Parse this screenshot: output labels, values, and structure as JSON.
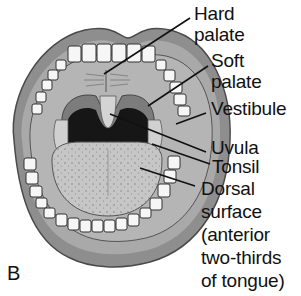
{
  "panel_letter": "B",
  "labels": [
    {
      "id": "hard-palate",
      "lines": [
        "Hard",
        "palate"
      ]
    },
    {
      "id": "soft-palate",
      "lines": [
        "Soft",
        "palate"
      ]
    },
    {
      "id": "vestibule",
      "lines": [
        "Vestibule"
      ]
    },
    {
      "id": "uvula",
      "lines": [
        "Uvula"
      ]
    },
    {
      "id": "tonsil",
      "lines": [
        "Tonsil"
      ]
    },
    {
      "id": "dorsal-surface",
      "lines": [
        "Dorsal",
        "surface",
        "(anterior",
        "two-thirds",
        "of tongue)"
      ]
    }
  ],
  "colors": {
    "lip": "#8a8a8a",
    "lip_edge": "#555555",
    "oral_cavity": "#b8b8b8",
    "pharynx": "#1a1a1a",
    "tongue": "#c4c4c4",
    "teeth": "#f4f4f4",
    "leader_line": "#111111"
  }
}
